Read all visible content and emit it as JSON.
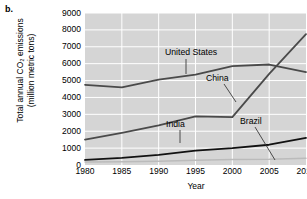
{
  "panel": {
    "letter": "b."
  },
  "chart_data": {
    "type": "line",
    "title": "",
    "xlabel": "Year",
    "ylabel_line1": "Total annual CO₂ emissions",
    "ylabel_line2": "(million metric tons)",
    "xlim": [
      1980,
      2010
    ],
    "ylim": [
      0,
      9000
    ],
    "grid": true,
    "legend_position": "inline-labels",
    "plot_bgcolor": "#d5d5d5",
    "gridcolor": "#ffffff",
    "x": [
      1980,
      1985,
      1990,
      1995,
      2000,
      2005,
      2010
    ],
    "xticks": [
      "1980",
      "1985",
      "1990",
      "1995",
      "2000",
      "2005",
      "2010"
    ],
    "yticks": [
      "0",
      "1000",
      "2000",
      "3000",
      "4000",
      "5000",
      "6000",
      "7000",
      "8000",
      "9000"
    ],
    "series": [
      {
        "name": "United States",
        "color": "#4a4a4a",
        "width": 1.8,
        "x": [
          1980,
          1985,
          1990,
          1995,
          2000,
          2005,
          2010
        ],
        "values": [
          4750,
          4600,
          5050,
          5350,
          5850,
          5950,
          5500
        ]
      },
      {
        "name": "China",
        "color": "#4a4a4a",
        "width": 1.8,
        "x": [
          1980,
          1985,
          1990,
          1995,
          2000,
          2005,
          2010
        ],
        "values": [
          1500,
          1900,
          2350,
          2880,
          2830,
          5400,
          7750
        ]
      },
      {
        "name": "India",
        "color": "#111111",
        "width": 1.8,
        "x": [
          1980,
          1985,
          1990,
          1995,
          2000,
          2005,
          2010
        ],
        "values": [
          300,
          420,
          600,
          850,
          1000,
          1200,
          1600
        ]
      },
      {
        "name": "Brazil",
        "color": "#bbbbbb",
        "width": 1.5,
        "x": [
          1980,
          1985,
          1990,
          1995,
          2000,
          2005,
          2010
        ],
        "values": [
          180,
          190,
          220,
          280,
          330,
          340,
          400
        ]
      }
    ],
    "annotations": [
      {
        "text": "United States",
        "label_x": 165,
        "label_y": 47,
        "leader": {
          "x1": 186,
          "y1": 59,
          "x2": 186,
          "y2": 74
        }
      },
      {
        "text": "China",
        "label_x": 206,
        "label_y": 73,
        "leader": {
          "x1": 224,
          "y1": 84,
          "x2": 236,
          "y2": 102
        }
      },
      {
        "text": "India",
        "label_x": 166,
        "label_y": 119,
        "leader": {
          "x1": 180,
          "y1": 130,
          "x2": 180,
          "y2": 143
        }
      },
      {
        "text": "Brazil",
        "label_x": 240,
        "label_y": 116,
        "leader": {
          "x1": 255,
          "y1": 127,
          "x2": 275,
          "y2": 160
        }
      }
    ]
  }
}
